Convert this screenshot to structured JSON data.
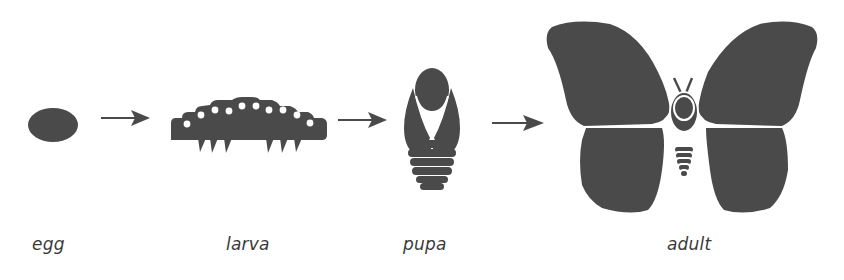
{
  "diagram": {
    "fill_color": "#4a4a4a",
    "stages": [
      {
        "id": "egg",
        "label": "egg",
        "label_x": 32
      },
      {
        "id": "larva",
        "label": "larva",
        "label_x": 226
      },
      {
        "id": "pupa",
        "label": "pupa",
        "label_x": 403
      },
      {
        "id": "adult",
        "label": "adult",
        "label_x": 667
      }
    ],
    "arrows": [
      {
        "from": "egg",
        "to": "larva"
      },
      {
        "from": "larva",
        "to": "pupa"
      },
      {
        "from": "pupa",
        "to": "adult"
      }
    ]
  }
}
